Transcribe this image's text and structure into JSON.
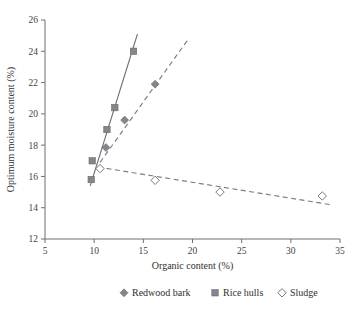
{
  "chart_data": {
    "type": "scatter",
    "title": "",
    "xlabel": "Organic content (%)",
    "ylabel": "Optimum moisture content (%)",
    "xlim": [
      5,
      35
    ],
    "ylim": [
      12,
      26
    ],
    "xticks": [
      5,
      10,
      15,
      20,
      25,
      30,
      35
    ],
    "yticks": [
      12,
      14,
      16,
      18,
      20,
      22,
      24,
      26
    ],
    "grid": false,
    "legend_position": "bottom",
    "series": [
      {
        "name": "Redwood bark",
        "marker": "filled-diamond",
        "color": "#85858c",
        "line_style": "dashed",
        "points": [
          {
            "x": 11.2,
            "y": 17.85
          },
          {
            "x": 13.1,
            "y": 19.6
          },
          {
            "x": 16.2,
            "y": 21.9
          }
        ],
        "trendline": {
          "x1": 10.6,
          "y1": 16.9,
          "x2": 19.6,
          "y2": 24.8
        }
      },
      {
        "name": "Rice hulls",
        "marker": "filled-square",
        "color": "#85858c",
        "line_style": "solid",
        "points": [
          {
            "x": 9.7,
            "y": 15.8
          },
          {
            "x": 9.8,
            "y": 17.0
          },
          {
            "x": 11.3,
            "y": 19.0
          },
          {
            "x": 12.1,
            "y": 20.4
          },
          {
            "x": 14.0,
            "y": 24.0
          }
        ],
        "trendline": {
          "x1": 9.6,
          "y1": 15.4,
          "x2": 14.4,
          "y2": 25.1
        }
      },
      {
        "name": "Sludge",
        "marker": "open-diamond",
        "color": "#ffffff",
        "line_style": "dashed",
        "points": [
          {
            "x": 10.6,
            "y": 16.5
          },
          {
            "x": 16.2,
            "y": 15.75
          },
          {
            "x": 22.8,
            "y": 15.0
          },
          {
            "x": 33.2,
            "y": 14.75
          }
        ],
        "trendline": {
          "x1": 10.4,
          "y1": 16.6,
          "x2": 34.0,
          "y2": 14.2
        }
      }
    ]
  },
  "legend": {
    "items": [
      {
        "label": "Redwood bark",
        "marker": "filled-diamond"
      },
      {
        "label": "Rice hulls",
        "marker": "filled-square"
      },
      {
        "label": "Sludge",
        "marker": "open-diamond"
      }
    ]
  },
  "axes": {
    "x_title": "Organic content (%)",
    "y_title": "Optimum moisture content (%)",
    "x_tick_labels": [
      "5",
      "10",
      "15",
      "20",
      "25",
      "30",
      "35"
    ],
    "y_tick_labels": [
      "12",
      "14",
      "16",
      "18",
      "20",
      "22",
      "24",
      "26"
    ]
  },
  "colors": {
    "marker_fill": "#85858c",
    "marker_stroke": "#6a6a71",
    "line": "#6e6e74",
    "axis": "#6f6f6f",
    "text": "#2f2f2f",
    "background": "#ffffff"
  }
}
